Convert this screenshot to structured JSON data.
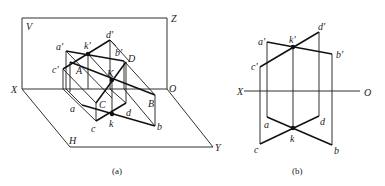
{
  "figure_a": {
    "caption": "(a)",
    "planes": {
      "V": "V",
      "H": "H"
    },
    "axes": {
      "X": "X",
      "O": "O",
      "Z": "Z",
      "Y": "Y"
    },
    "points_upper": {
      "a_prime": "a'",
      "k_prime": "k'",
      "d_prime": "d'",
      "b_prime": "b'",
      "c_prime": "c'"
    },
    "points_space": {
      "A": "A",
      "B": "B",
      "C": "C",
      "D": "D",
      "K": "K"
    },
    "points_lower": {
      "a": "a",
      "c": "c",
      "k": "k",
      "d": "d",
      "b": "b"
    }
  },
  "figure_b": {
    "caption": "(b)",
    "axes": {
      "X": "X",
      "O": "O"
    },
    "points_upper": {
      "a_prime": "a'",
      "k_prime": "k'",
      "d_prime": "d'",
      "b_prime": "b'",
      "c_prime": "c'"
    },
    "points_lower": {
      "a": "a",
      "k": "k",
      "d": "d",
      "c": "c",
      "b": "b"
    }
  }
}
